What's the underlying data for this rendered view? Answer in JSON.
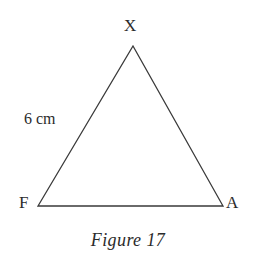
{
  "figure": {
    "caption": "Figure 17",
    "background_color": "#ffffff",
    "stroke_color": "#3a3a3a",
    "text_color": "#2b2b2b",
    "shape": "triangle",
    "vertices": [
      {
        "name": "X",
        "label": "X",
        "x": 133,
        "y": 46,
        "label_x": 124,
        "label_y": 17
      },
      {
        "name": "F",
        "label": "F",
        "x": 38,
        "y": 206,
        "label_x": 19,
        "label_y": 194
      },
      {
        "name": "A",
        "label": "A",
        "x": 223,
        "y": 206,
        "label_x": 226,
        "label_y": 194
      }
    ],
    "side_labels": [
      {
        "side": "FX",
        "label": "6 cm",
        "value": 6,
        "unit": "cm",
        "label_x": 24,
        "label_y": 110
      }
    ],
    "stroke_width": 1.3
  },
  "chart_data": {
    "type": "diagram",
    "title": "Figure 17",
    "shape": "triangle",
    "points": {
      "X": [
        133,
        46
      ],
      "F": [
        38,
        206
      ],
      "A": [
        223,
        206
      ]
    },
    "edges": [
      [
        "F",
        "X"
      ],
      [
        "X",
        "A"
      ],
      [
        "F",
        "A"
      ]
    ],
    "annotations": [
      {
        "text": "6 cm",
        "attached_to_edge": [
          "F",
          "X"
        ],
        "position": [
          24,
          110
        ]
      },
      {
        "text": "X",
        "attached_to_vertex": "X",
        "position": [
          124,
          17
        ]
      },
      {
        "text": "F",
        "attached_to_vertex": "F",
        "position": [
          19,
          194
        ]
      },
      {
        "text": "A",
        "attached_to_vertex": "A",
        "position": [
          226,
          194
        ]
      }
    ]
  }
}
